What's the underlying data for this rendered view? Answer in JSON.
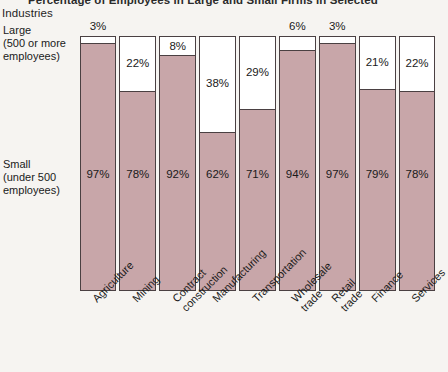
{
  "chart_data": {
    "type": "bar",
    "title": "Percentage of Employees in Large and Small Firms in Selected Industries",
    "title_line1": "Percentage of Employees in Large and Small Firms in Selected",
    "title_line2": "Industries",
    "xlabel": "",
    "ylabel": "",
    "ylim": [
      0,
      100
    ],
    "grid": false,
    "legend_position": "left-axis-labels",
    "stacked": true,
    "categories": [
      "Agriculture",
      "Mining",
      "Contract\nconstruction",
      "Manufacturing",
      "Transportation",
      "Wholesale\ntrade",
      "Retail\ntrade",
      "Finance",
      "Services"
    ],
    "series": [
      {
        "name": "Large (500 or more employees)",
        "color": "#ffffff",
        "values": [
          3,
          22,
          8,
          38,
          29,
          6,
          3,
          21,
          22
        ],
        "labels": [
          "3%",
          "22%",
          "8%",
          "38%",
          "29%",
          "6%",
          "3%",
          "21%",
          "22%"
        ]
      },
      {
        "name": "Small (under 500 employees)",
        "color": "#c8a6a9",
        "values": [
          97,
          78,
          92,
          62,
          71,
          94,
          97,
          79,
          78
        ],
        "labels": [
          "97%",
          "78%",
          "92%",
          "62%",
          "71%",
          "94%",
          "97%",
          "79%",
          "78%"
        ]
      }
    ],
    "large_label_placement": [
      "outside",
      "inside",
      "inside",
      "inside",
      "inside",
      "outside",
      "outside",
      "inside",
      "inside"
    ]
  },
  "axis": {
    "large_label": "Large\n(500 or more\nemployees)",
    "large_label_lines": [
      "Large",
      "(500 or more",
      "employees)"
    ],
    "small_label": "Small\n(under 500\nemployees)",
    "small_label_lines": [
      "Small",
      "(under 500",
      "employees)"
    ]
  },
  "colors": {
    "small_fill": "#c8a6a9",
    "large_fill": "#ffffff",
    "outline": "#4a4042",
    "background": "#f6f4f1",
    "text": "#1a1a1a"
  }
}
